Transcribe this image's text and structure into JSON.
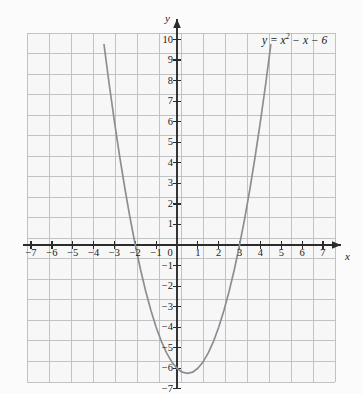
{
  "figure": {
    "background_color": "#fbfbfb",
    "grid_color": "#b9bcc0",
    "grid_minor_color": "#d4d7da",
    "axis_color": "#2b2b2b",
    "curve_color": "#8b8f93",
    "text_color": "#1a1a1a"
  },
  "axes": {
    "x_axis_name": "x",
    "y_axis_name": "y",
    "origin_label": "0",
    "x_tick_labels": [
      "−7",
      "−6",
      "−5",
      "−4",
      "−3",
      "−2",
      "−1",
      "1",
      "2",
      "3",
      "4",
      "5",
      "6",
      "7"
    ],
    "y_tick_labels": [
      "10",
      "9",
      "8",
      "7",
      "6",
      "5",
      "4",
      "3",
      "2",
      "1",
      "−1",
      "−2",
      "−3",
      "−4",
      "−5",
      "−6",
      "−7"
    ]
  },
  "curve": {
    "label_prefix": "y = x",
    "label_exponent": "2",
    "label_suffix": " − x − 6"
  },
  "chart_data": {
    "type": "line",
    "title": "",
    "subtitle": "",
    "xlabel": "x",
    "ylabel": "y",
    "equation": "y = x^2 - x - 6",
    "grid": true,
    "legend": "none",
    "annotations": [
      "y = x² − x − 6"
    ],
    "xlim": [
      -7.8,
      7.8
    ],
    "ylim": [
      -7.6,
      11.2
    ],
    "xticks": [
      -7,
      -6,
      -5,
      -4,
      -3,
      -2,
      -1,
      0,
      1,
      2,
      3,
      4,
      5,
      6,
      7
    ],
    "yticks": [
      -7,
      -6,
      -5,
      -4,
      -3,
      -2,
      -1,
      0,
      1,
      2,
      3,
      4,
      5,
      6,
      7,
      8,
      9,
      10
    ],
    "xtick_labels": [
      "-7",
      "-6",
      "-5",
      "-4",
      "-3",
      "-2",
      "-1",
      "0",
      "1",
      "2",
      "3",
      "4",
      "5",
      "6",
      "7"
    ],
    "ytick_labels": [
      "-7",
      "-6",
      "-5",
      "-4",
      "-3",
      "-2",
      "-1",
      "1",
      "2",
      "3",
      "4",
      "5",
      "6",
      "7",
      "8",
      "9",
      "10"
    ],
    "x_domain_drawn": [
      -3.5,
      4.5
    ],
    "roots": [
      -2,
      3
    ],
    "vertex": [
      0.5,
      -6.25
    ],
    "y_intercept": -6,
    "series": [
      {
        "name": "y = x^2 - x - 6",
        "color": "#8b8f93",
        "x": [
          -3.5,
          -3.25,
          -3.0,
          -2.75,
          -2.5,
          -2.25,
          -2.0,
          -1.75,
          -1.5,
          -1.25,
          -1.0,
          -0.75,
          -0.5,
          -0.25,
          0.0,
          0.25,
          0.5,
          0.75,
          1.0,
          1.25,
          1.5,
          1.75,
          2.0,
          2.25,
          2.5,
          2.75,
          3.0,
          3.25,
          3.5,
          3.75,
          4.0,
          4.25,
          4.5
        ],
        "y": [
          9.75,
          7.81,
          6.0,
          4.31,
          2.75,
          1.31,
          0.0,
          -1.19,
          -2.25,
          -3.19,
          -4.0,
          -4.69,
          -5.25,
          -5.69,
          -6.0,
          -6.19,
          -6.25,
          -6.19,
          -6.0,
          -5.69,
          -5.25,
          -4.69,
          -4.0,
          -3.19,
          -2.25,
          -1.19,
          0.0,
          1.31,
          2.75,
          4.31,
          6.0,
          7.81,
          9.75
        ]
      }
    ]
  }
}
